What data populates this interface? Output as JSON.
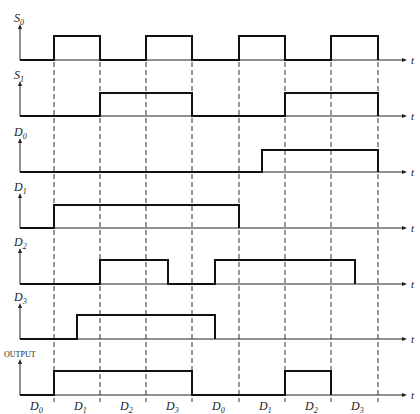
{
  "diagram": {
    "type": "timing-diagram",
    "time_axis_label": "t",
    "slot_boundaries_x": [
      54,
      100,
      146,
      192,
      239,
      285,
      331,
      378
    ],
    "signals": [
      {
        "name": "S",
        "sub": "0",
        "baseline_y": 60,
        "high_y": 36,
        "high_intervals": [
          [
            54,
            100
          ],
          [
            146,
            192
          ],
          [
            239,
            285
          ],
          [
            331,
            378
          ]
        ]
      },
      {
        "name": "S",
        "sub": "1",
        "baseline_y": 116,
        "high_y": 93,
        "high_intervals": [
          [
            100,
            192
          ],
          [
            285,
            378
          ]
        ]
      },
      {
        "name": "D",
        "sub": "0",
        "baseline_y": 172,
        "high_y": 150,
        "high_intervals": [
          [
            262,
            378
          ]
        ]
      },
      {
        "name": "D",
        "sub": "1",
        "baseline_y": 228,
        "high_y": 205,
        "high_intervals": [
          [
            54,
            239
          ]
        ]
      },
      {
        "name": "D",
        "sub": "2",
        "baseline_y": 284,
        "high_y": 260,
        "high_intervals": [
          [
            100,
            168
          ],
          [
            215,
            355
          ]
        ]
      },
      {
        "name": "D",
        "sub": "3",
        "baseline_y": 339,
        "high_y": 315,
        "high_intervals": [
          [
            77,
            215
          ]
        ]
      },
      {
        "name": "OUTPUT",
        "sub": "",
        "baseline_y": 395,
        "high_y": 371,
        "high_intervals": [
          [
            54,
            192
          ],
          [
            285,
            331
          ]
        ]
      }
    ],
    "bottom_labels": [
      {
        "name": "D",
        "sub": "0",
        "x": 30
      },
      {
        "name": "D",
        "sub": "1",
        "x": 74
      },
      {
        "name": "D",
        "sub": "2",
        "x": 120
      },
      {
        "name": "D",
        "sub": "3",
        "x": 166
      },
      {
        "name": "D",
        "sub": "0",
        "x": 212
      },
      {
        "name": "D",
        "sub": "1",
        "x": 259
      },
      {
        "name": "D",
        "sub": "2",
        "x": 305
      },
      {
        "name": "D",
        "sub": "3",
        "x": 351
      }
    ]
  }
}
